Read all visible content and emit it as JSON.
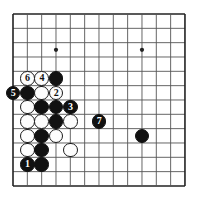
{
  "board": {
    "kind": "go-board-diagram",
    "columns": 13,
    "rows": 13,
    "origin_x": 13,
    "origin_y": 14,
    "spacing": 14.33,
    "stone_radius": 7.2,
    "line_color": "#555555",
    "edge_color": "#222222",
    "black_color": "#111111",
    "white_color": "#fdfdfd",
    "background": "#ffffff",
    "star_points": [
      {
        "col": 3,
        "row": 2.5
      },
      {
        "col": 9,
        "row": 2.5
      }
    ],
    "stones": [
      {
        "col": 1,
        "row": 4.5,
        "color": "white",
        "label": "6"
      },
      {
        "col": 2,
        "row": 4.5,
        "color": "white",
        "label": "4"
      },
      {
        "col": 3,
        "row": 4.5,
        "color": "black",
        "label": ""
      },
      {
        "col": 0,
        "row": 5.5,
        "color": "black",
        "label": "5"
      },
      {
        "col": 1,
        "row": 5.5,
        "color": "black",
        "label": ""
      },
      {
        "col": 2,
        "row": 5.5,
        "color": "white",
        "label": ""
      },
      {
        "col": 3,
        "row": 5.5,
        "color": "white",
        "label": "2"
      },
      {
        "col": 1,
        "row": 6.5,
        "color": "white",
        "label": ""
      },
      {
        "col": 2,
        "row": 6.5,
        "color": "black",
        "label": ""
      },
      {
        "col": 3,
        "row": 6.5,
        "color": "black",
        "label": ""
      },
      {
        "col": 4,
        "row": 6.5,
        "color": "black",
        "label": "3"
      },
      {
        "col": 1,
        "row": 7.5,
        "color": "white",
        "label": ""
      },
      {
        "col": 2,
        "row": 7.5,
        "color": "white",
        "label": ""
      },
      {
        "col": 3,
        "row": 7.5,
        "color": "black",
        "label": ""
      },
      {
        "col": 4,
        "row": 7.5,
        "color": "white",
        "label": ""
      },
      {
        "col": 6,
        "row": 7.5,
        "color": "black",
        "label": "7"
      },
      {
        "col": 1,
        "row": 8.5,
        "color": "white",
        "label": ""
      },
      {
        "col": 2,
        "row": 8.5,
        "color": "black",
        "label": ""
      },
      {
        "col": 3,
        "row": 8.5,
        "color": "white",
        "label": ""
      },
      {
        "col": 9,
        "row": 8.5,
        "color": "black",
        "label": ""
      },
      {
        "col": 1,
        "row": 9.5,
        "color": "white",
        "label": ""
      },
      {
        "col": 2,
        "row": 9.5,
        "color": "black",
        "label": ""
      },
      {
        "col": 4,
        "row": 9.5,
        "color": "white",
        "label": ""
      },
      {
        "col": 1,
        "row": 10.5,
        "color": "black",
        "label": "1"
      },
      {
        "col": 2,
        "row": 10.5,
        "color": "black",
        "label": ""
      }
    ],
    "move_labels": [
      "1",
      "2",
      "3",
      "4",
      "5",
      "6",
      "7"
    ]
  }
}
